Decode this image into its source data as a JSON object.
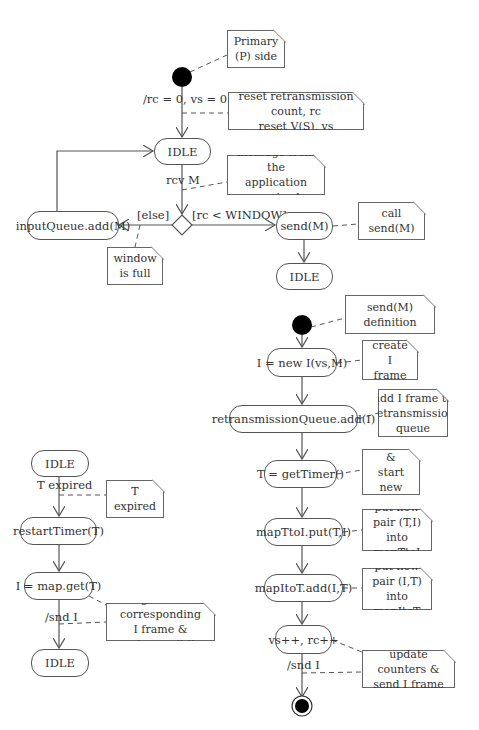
{
  "diagram": {
    "type": "UML activity/state diagram",
    "top_flow": {
      "initial_note": "Primary\n(P) side",
      "init_transition_label": "/rc = 0, vs = 0",
      "init_note": "reset retransmission count, rc\nreset V(S), vs",
      "idle_1": "IDLE",
      "rcv_label": "rcv M",
      "rcv_note": "message from the\napplication received",
      "else_guard": "[else]",
      "window_guard": "[rc < WINDOW]",
      "input_queue_state": "inputQueue.add(M)",
      "window_full_note": "window\nis full",
      "send_state": "send(M)",
      "send_note": "call send(M)",
      "idle_2": "IDLE"
    },
    "send_definition_flow": {
      "title_note": "send(M) definition",
      "steps": [
        {
          "state": "I = new I(vs,M)",
          "note": "create I\nframe"
        },
        {
          "state": "retransmissionQueue.add(I)",
          "note": "add I frame to\nretransmission\nqueue"
        },
        {
          "state": "T = getTimer()",
          "note": "allocate &\nstart new\ntimer"
        },
        {
          "state": "mapTtoI.put(T,I)",
          "note": "put new\npair (T,I)\ninto mapTtoI"
        },
        {
          "state": "mapItoT.add(I,T)",
          "note": "put new\npair (I,T)\ninto mapItoT"
        },
        {
          "state": "vs++, rc++",
          "note": "update counters &\nsend I frame"
        }
      ],
      "final_transition_label": "/snd I"
    },
    "timer_flow": {
      "idle_start": "IDLE",
      "trigger_label": "T expired",
      "trigger_note": "T expired",
      "restart_state": "restartTimer(T)",
      "get_state": "I = map.get(T)",
      "send_label": "/snd I",
      "get_note": "get the corresponding\nI frame & retransmit it",
      "idle_end": "IDLE"
    }
  },
  "colors": {
    "line": "#555555",
    "node_fill": "#000000",
    "background": "#ffffff"
  }
}
